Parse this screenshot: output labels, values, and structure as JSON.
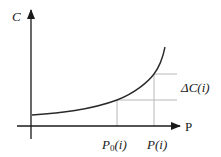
{
  "figure": {
    "type": "cost-vs-price-curve",
    "axes": {
      "y_label": "C",
      "x_label": "P"
    },
    "markers": {
      "p0_label_main": "P",
      "p0_label_sub": "0",
      "p0_label_tail": "(i)",
      "p_label": "P(i)",
      "delta_label": "ΔC(i)"
    },
    "colors": {
      "axis": "#1a1a1a",
      "curve": "#2a2a2a",
      "guide": "#b8b8b8",
      "background": "#ffffff"
    }
  }
}
